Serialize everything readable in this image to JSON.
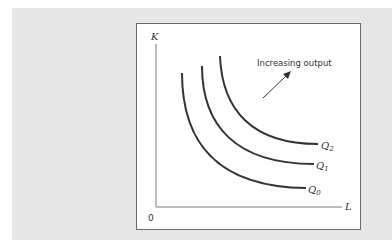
{
  "diagram": {
    "title_annotation": "Increasing output",
    "axes": {
      "y_label": "K",
      "x_label": "L",
      "origin_label": "0"
    },
    "curves": [
      {
        "id": "Q0",
        "label": "Q",
        "subscript": "0"
      },
      {
        "id": "Q1",
        "label": "Q",
        "subscript": "1"
      },
      {
        "id": "Q2",
        "label": "Q",
        "subscript": "2"
      }
    ],
    "colors": {
      "panel_bg": "#e6e6e6",
      "box_bg": "#ffffff",
      "curve": "#333333",
      "axis": "#7a7a7a"
    }
  }
}
